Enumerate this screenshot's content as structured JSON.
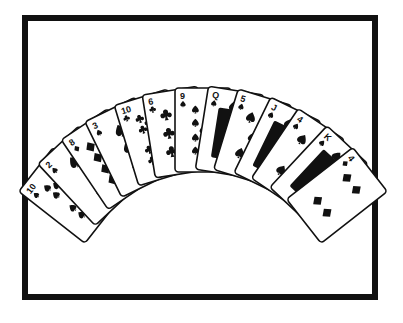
{
  "image": {
    "kind": "line-drawing",
    "subject": "fan-of-playing-cards",
    "style": "black-and-white clip art",
    "background_color": "#ffffff",
    "ink_color": "#111111"
  },
  "frame": {
    "name": "picture-border",
    "color": "#111111",
    "thickness_px": 6,
    "x": 22,
    "y": 15,
    "width": 356,
    "height": 285
  },
  "fan": {
    "name": "card-fan",
    "count": 13,
    "arrangement": "arc, overlapping left-to-right, concave-up",
    "center_x": 203,
    "center_y": 300,
    "radius": 170,
    "start_angle_deg": -52,
    "end_angle_deg": 52,
    "card_width": 56,
    "card_height": 84,
    "cards": [
      {
        "index": 1,
        "rank": "10",
        "suit": "spade",
        "suit_symbol": "♠",
        "label": "10 of Spades",
        "angle_deg": -52,
        "pip_count": 10
      },
      {
        "index": 2,
        "rank": "2",
        "suit": "spade",
        "suit_symbol": "♠",
        "label": "2 of Spades",
        "angle_deg": -43,
        "pip_count": 2
      },
      {
        "index": 3,
        "rank": "8",
        "suit": "diamond",
        "suit_symbol": "♦",
        "label": "8 of Diamonds",
        "angle_deg": -34,
        "pip_count": 8
      },
      {
        "index": 4,
        "rank": "3",
        "suit": "spade",
        "suit_symbol": "♠",
        "label": "3 of Spades",
        "angle_deg": -26,
        "pip_count": 3
      },
      {
        "index": 5,
        "rank": "10",
        "suit": "club",
        "suit_symbol": "♣",
        "label": "10 of Clubs",
        "angle_deg": -17,
        "pip_count": 10
      },
      {
        "index": 6,
        "rank": "6",
        "suit": "club",
        "suit_symbol": "♣",
        "label": "6 of Clubs",
        "angle_deg": -9,
        "pip_count": 6
      },
      {
        "index": 7,
        "rank": "9",
        "suit": "spade",
        "suit_symbol": "♠",
        "label": "9 of Spades",
        "angle_deg": 0,
        "pip_count": 9
      },
      {
        "index": 8,
        "rank": "Q",
        "suit": "spade",
        "suit_symbol": "♠",
        "label": "Queen of Spades",
        "angle_deg": 9,
        "pip_count": 0,
        "court": true
      },
      {
        "index": 9,
        "rank": "5",
        "suit": "spade",
        "suit_symbol": "♠",
        "label": "5 of Spades",
        "angle_deg": 17,
        "pip_count": 5
      },
      {
        "index": 10,
        "rank": "J",
        "suit": "spade",
        "suit_symbol": "♠",
        "label": "Jack of Spades",
        "angle_deg": 26,
        "pip_count": 0,
        "court": true
      },
      {
        "index": 11,
        "rank": "4",
        "suit": "spade",
        "suit_symbol": "♠",
        "label": "4 of Spades",
        "angle_deg": 34,
        "pip_count": 4
      },
      {
        "index": 12,
        "rank": "K",
        "suit": "spade",
        "suit_symbol": "♠",
        "label": "King of Spades",
        "angle_deg": 43,
        "pip_count": 0,
        "court": true
      },
      {
        "index": 13,
        "rank": "4",
        "suit": "diamond",
        "suit_symbol": "♦",
        "label": "4 of Diamonds",
        "angle_deg": 52,
        "pip_count": 4
      }
    ]
  }
}
